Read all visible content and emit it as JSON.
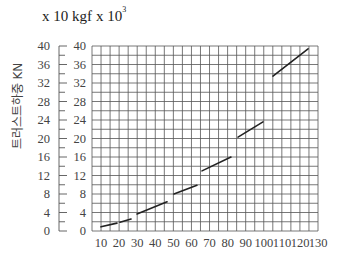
{
  "header": {
    "unit_left": "x 10 kgf",
    "unit_right_prefix": "x  10",
    "unit_right_exp": "3"
  },
  "y_axis_label": "트러스트하중 KN",
  "chart_data": {
    "type": "line",
    "title": "",
    "xlabel": "",
    "ylabel": "트러스트하중 KN",
    "y_units": [
      "x 10 kgf",
      "x 10^3"
    ],
    "xlim": [
      5,
      130
    ],
    "ylim": [
      0,
      40
    ],
    "x_ticks": [
      10,
      20,
      30,
      40,
      50,
      60,
      70,
      80,
      90,
      100,
      110,
      120,
      130
    ],
    "y_ticks_left": [
      0,
      4,
      8,
      12,
      16,
      20,
      24,
      28,
      32,
      36,
      40
    ],
    "y_ticks_right": [
      0,
      4,
      8,
      12,
      16,
      20,
      24,
      28,
      32,
      36,
      40
    ],
    "grid": true,
    "legend": null,
    "line_style": "dashed segments",
    "series": [
      {
        "name": "thrust load",
        "segments": [
          [
            [
              10,
              0.9
            ],
            [
              18.8,
              1.7
            ]
          ],
          [
            [
              20.5,
              1.9
            ],
            [
              26.6,
              2.6
            ]
          ],
          [
            [
              29.9,
              3.7
            ],
            [
              46.5,
              6.3
            ]
          ],
          [
            [
              50.3,
              8.0
            ],
            [
              63.0,
              9.9
            ]
          ],
          [
            [
              65.8,
              13.0
            ],
            [
              81.8,
              16.0
            ]
          ],
          [
            [
              85.7,
              20.3
            ],
            [
              99.5,
              23.6
            ]
          ],
          [
            [
              105.0,
              33.5
            ],
            [
              124.4,
              39.4
            ]
          ]
        ]
      }
    ]
  }
}
